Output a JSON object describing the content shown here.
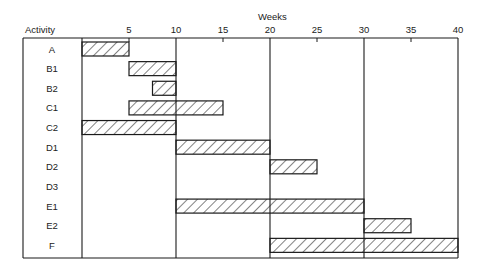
{
  "chart_data": {
    "type": "gantt",
    "title": "",
    "xlabel": "Weeks",
    "ylabel": "Activity",
    "xlim": [
      0,
      40
    ],
    "x_ticks": [
      5,
      10,
      15,
      20,
      25,
      30,
      35,
      40
    ],
    "major_gridlines": [
      10,
      20,
      30,
      40
    ],
    "grid": "vertical lines at 10-week intervals",
    "legend": "none",
    "bar_fill": "diagonal hatch",
    "activities": [
      {
        "name": "A",
        "start": 0,
        "end": 5
      },
      {
        "name": "B1",
        "start": 5,
        "end": 10
      },
      {
        "name": "B2",
        "start": 7.5,
        "end": 10
      },
      {
        "name": "C1",
        "start": 5,
        "end": 15
      },
      {
        "name": "C2",
        "start": 0,
        "end": 10
      },
      {
        "name": "D1",
        "start": 10,
        "end": 20
      },
      {
        "name": "D2",
        "start": 20,
        "end": 25
      },
      {
        "name": "D3",
        "start": null,
        "end": null
      },
      {
        "name": "E1",
        "start": 10,
        "end": 30
      },
      {
        "name": "E2",
        "start": 30,
        "end": 35
      },
      {
        "name": "F",
        "start": 20,
        "end": 40
      }
    ]
  },
  "labels": {
    "activity_header": "Activity",
    "weeks_label": "Weeks"
  },
  "colors": {
    "line": "#1a1a1a",
    "background": "#ffffff"
  }
}
